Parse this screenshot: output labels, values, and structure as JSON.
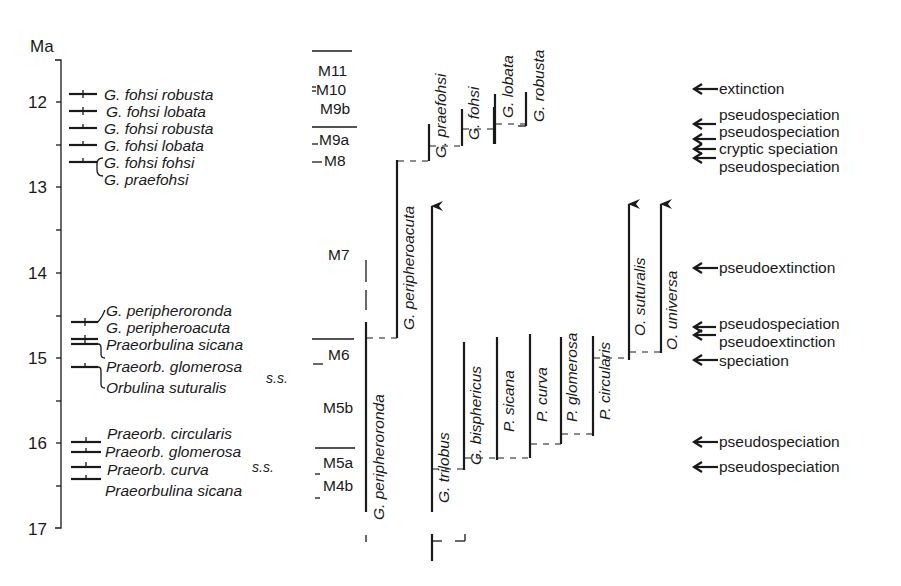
{
  "axis": {
    "unit": "Ma",
    "ticks": [
      "12",
      "13",
      "14",
      "15",
      "16",
      "17"
    ]
  },
  "left_events": [
    {
      "label": "G. fohsi robusta"
    },
    {
      "label": "G. fohsi lobata"
    },
    {
      "label": "G. fohsi robusta"
    },
    {
      "label": "G. fohsi lobata"
    },
    {
      "label": "G. fohsi fohsi"
    },
    {
      "label": "G. praefohsi"
    },
    {
      "label": "G. peripheroronda"
    },
    {
      "label": "G. peripheroacuta"
    },
    {
      "label": "Praeorbulina sicana"
    },
    {
      "label": "Praeorb. glomerosa"
    },
    {
      "label": "Orbulina suturalis"
    },
    {
      "label": "Praeorb. circularis"
    },
    {
      "label": "Praeorb. glomerosa"
    },
    {
      "label": "Praeorb. curva"
    },
    {
      "label": "Praeorbulina sicana"
    }
  ],
  "ss_labels": [
    "s.s.",
    "s.s."
  ],
  "zones": [
    "M11",
    "M10",
    "M9b",
    "M9a",
    "M8",
    "M7",
    "M6",
    "M5b",
    "M5a",
    "M4b"
  ],
  "lineages": [
    {
      "label": "G. praefohsi"
    },
    {
      "label": "G. fohsi"
    },
    {
      "label": "G. lobata"
    },
    {
      "label": "G. robusta"
    },
    {
      "label": "G. peripheroacuta"
    },
    {
      "label": "G. peripheroronda"
    },
    {
      "label": "G. trilobus"
    },
    {
      "label": "G. bisphericus"
    },
    {
      "label": "P. sicana"
    },
    {
      "label": "P. curva"
    },
    {
      "label": "P. glomerosa"
    },
    {
      "label": "P. circularis"
    },
    {
      "label": "O. suturalis"
    },
    {
      "label": "O. universa"
    }
  ],
  "right_events": [
    {
      "label": "extinction"
    },
    {
      "label": "pseudospeciation"
    },
    {
      "label": "pseudospeciation"
    },
    {
      "label": "cryptic speciation"
    },
    {
      "label": "pseudospeciation"
    },
    {
      "label": "pseudoextinction"
    },
    {
      "label": "pseudospeciation"
    },
    {
      "label": "pseudoextinction"
    },
    {
      "label": "speciation"
    },
    {
      "label": "pseudospeciation"
    },
    {
      "label": "pseudospeciation"
    }
  ]
}
